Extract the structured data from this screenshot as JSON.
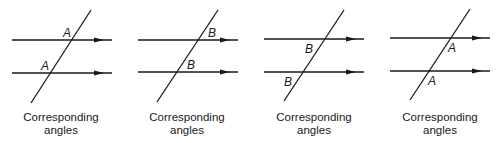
{
  "panels": [
    {
      "caption_line1": "Corresponding",
      "caption_line2": "angles",
      "labels": [
        "A",
        "A"
      ],
      "label_position": "upper-left"
    },
    {
      "caption_line1": "Corresponding",
      "caption_line2": "angles",
      "labels": [
        "B",
        "B"
      ],
      "label_position": "upper-right"
    },
    {
      "caption_line1": "Corresponding",
      "caption_line2": "angles",
      "labels": [
        "B",
        "B"
      ],
      "label_position": "lower-left"
    },
    {
      "caption_line1": "Corresponding",
      "caption_line2": "angles",
      "labels": [
        "A",
        "A"
      ],
      "label_position": "lower-right"
    }
  ]
}
